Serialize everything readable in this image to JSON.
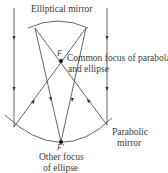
{
  "labels": {
    "elliptical_mirror": "Elliptical mirror",
    "focus_f": "F",
    "common_focus_line1": "Common focus of parabola",
    "common_focus_line2": "and ellipse",
    "parabolic_line1": "Parabolic",
    "parabolic_line2": "mirror",
    "focus_f_prime": "F'",
    "other_focus_line1": "Other focus",
    "other_focus_line2": "of ellipse"
  },
  "colors": {
    "line": "#555555",
    "text": "#3a3a3a",
    "point": "#111111"
  }
}
